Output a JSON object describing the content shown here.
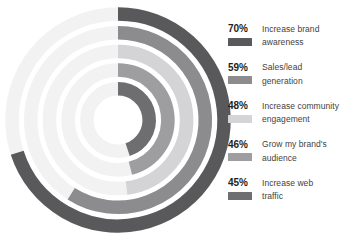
{
  "chart_data": {
    "type": "bar",
    "subtype": "radial-bar",
    "title": "",
    "subtitle": "",
    "xlabel": "",
    "ylabel": "",
    "categories": [
      "Increase brand awareness",
      "Sales/lead generation",
      "Increase community engagement",
      "Grow my brand's audience",
      "Increase web traffic"
    ],
    "values": [
      70,
      59,
      48,
      46,
      45
    ],
    "value_suffix": "%",
    "ylim": [
      0,
      100
    ],
    "grid": false,
    "legend_position": "right",
    "start_angle_deg": 0,
    "direction": "clockwise",
    "track_color": "#f2f2f2",
    "series": [
      {
        "name": "Percent of respondents",
        "values": [
          70,
          59,
          48,
          46,
          45
        ]
      }
    ],
    "points": [
      {
        "label": "Increase brand awareness",
        "value": 70,
        "display": "70%",
        "color": "#59595b",
        "ring": 1
      },
      {
        "label": "Sales/lead generation",
        "value": 59,
        "display": "59%",
        "color": "#8c8c8e",
        "ring": 2
      },
      {
        "label": "Increase community engagement",
        "value": 48,
        "display": "48%",
        "color": "#d4d4d6",
        "ring": 3
      },
      {
        "label": "Grow my brand's audience",
        "value": 46,
        "display": "46%",
        "color": "#9e9ea0",
        "ring": 4
      },
      {
        "label": "Increase web traffic",
        "value": 45,
        "display": "45%",
        "color": "#6e6e70",
        "ring": 5
      }
    ]
  },
  "legend": {
    "items": [
      {
        "percent": "70%",
        "label_line1": "Increase brand",
        "label_line2": "awareness",
        "color": "#59595b"
      },
      {
        "percent": "59%",
        "label_line1": "Sales/lead",
        "label_line2": "generation",
        "color": "#8c8c8e"
      },
      {
        "percent": "48%",
        "label_line1": "Increase community",
        "label_line2": "engagement",
        "color": "#d4d4d6"
      },
      {
        "percent": "46%",
        "label_line1": "Grow my brand's",
        "label_line2": "audience",
        "color": "#9e9ea0"
      },
      {
        "percent": "45%",
        "label_line1": "Increase web",
        "label_line2": "traffic",
        "color": "#6e6e70"
      }
    ]
  },
  "colors": {
    "background": "#ffffff",
    "text_primary": "#231f20",
    "text_secondary": "#3f3f41",
    "track": "#f2f2f2"
  }
}
